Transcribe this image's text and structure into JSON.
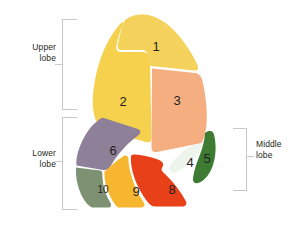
{
  "figure": {
    "background_color": "#ffffff"
  },
  "lobe_labels": [
    {
      "id": "upper",
      "line1": "Upper",
      "line2": "lobe",
      "side": "left"
    },
    {
      "id": "lower",
      "line1": "Lower",
      "line2": "lobe",
      "side": "left"
    },
    {
      "id": "middle",
      "line1": "Middle",
      "line2": "lobe",
      "side": "right"
    }
  ],
  "bracket_color": "#c9c9c9",
  "segments": [
    {
      "number": "1",
      "label": "1",
      "lobe": "upper",
      "color": "#F4D25C"
    },
    {
      "number": "2",
      "label": "2",
      "lobe": "upper",
      "color": "#F5D14E"
    },
    {
      "number": "3",
      "label": "3",
      "lobe": "upper",
      "color": "#F5AE80"
    },
    {
      "number": "4",
      "label": "4",
      "lobe": "middle",
      "color": "#EDF4EC"
    },
    {
      "number": "5",
      "label": "5",
      "lobe": "middle",
      "color": "#3E7B33"
    },
    {
      "number": "6",
      "label": "6",
      "lobe": "lower",
      "color": "#8F8099"
    },
    {
      "number": "8",
      "label": "8",
      "lobe": "lower",
      "color": "#E8411A"
    },
    {
      "number": "9",
      "label": "9",
      "lobe": "lower",
      "color": "#F6B630"
    },
    {
      "number": "10",
      "label": "10",
      "lobe": "lower",
      "color": "#7E9173"
    }
  ],
  "number_text_color": "#231f20",
  "label_text_color": "#231f20"
}
